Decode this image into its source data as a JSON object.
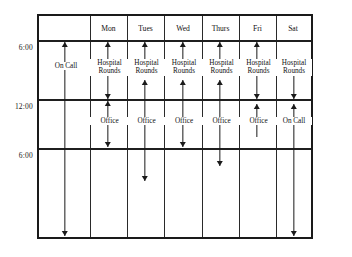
{
  "figure": {
    "type": "schedule-grid"
  },
  "time_labels": [
    {
      "text": "6:00",
      "y": 47
    },
    {
      "text": "12:00",
      "y": 106
    },
    {
      "text": "6:00",
      "y": 155
    }
  ],
  "columns": [
    {
      "key": "oncall",
      "label": ""
    },
    {
      "key": "mon",
      "label": "Mon"
    },
    {
      "key": "tues",
      "label": "Tues"
    },
    {
      "key": "wed",
      "label": "Wed"
    },
    {
      "key": "thurs",
      "label": "Thurs"
    },
    {
      "key": "fri",
      "label": "Fri"
    },
    {
      "key": "sat",
      "label": "Sat"
    }
  ],
  "activities": {
    "on_call": "On Call",
    "hospital_rounds_line1": "Hospital",
    "hospital_rounds_line2": "Rounds",
    "office": "Office"
  },
  "cells": [
    {
      "column": "oncall",
      "row": "morning",
      "label": "On Call"
    },
    {
      "column": "mon",
      "row": "morning",
      "label": "Hospital\nRounds"
    },
    {
      "column": "mon",
      "row": "afternoon",
      "label": "Office"
    },
    {
      "column": "tues",
      "row": "morning",
      "label": "Hospital\nRounds"
    },
    {
      "column": "tues",
      "row": "afternoon",
      "label": "Office"
    },
    {
      "column": "wed",
      "row": "morning",
      "label": "Hospital\nRounds"
    },
    {
      "column": "wed",
      "row": "afternoon",
      "label": "Office"
    },
    {
      "column": "thurs",
      "row": "morning",
      "label": "Hospital\nRounds"
    },
    {
      "column": "thurs",
      "row": "afternoon",
      "label": "Office"
    },
    {
      "column": "fri",
      "row": "morning",
      "label": "Hospital\nRounds"
    },
    {
      "column": "fri",
      "row": "afternoon",
      "label": "Office"
    },
    {
      "column": "sat",
      "row": "morning",
      "label": "Hospital\nRounds"
    },
    {
      "column": "sat",
      "row": "afternoon",
      "label": "On Call"
    }
  ],
  "colors": {
    "ink": "#1a1a1a",
    "rule": "#2a2a2a",
    "background": "#ffffff"
  }
}
